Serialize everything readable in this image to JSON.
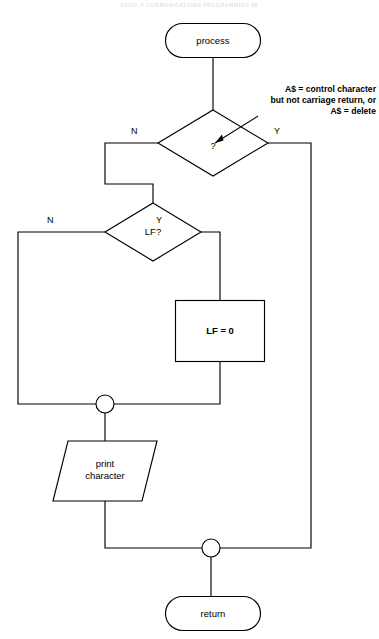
{
  "page": {
    "running_head": "CHAP. 4     COMMUNICATIONS PROGRAMMING          99",
    "width": 379,
    "height": 639,
    "background": "#ffffff",
    "line_color": "#000000"
  },
  "figure": {
    "type": "flowchart",
    "nodes": [
      {
        "id": "start-terminal",
        "shape": "terminator",
        "label": "process",
        "x": 165,
        "y": 23,
        "w": 96,
        "h": 35
      },
      {
        "id": "control-char-decision",
        "shape": "diamond",
        "label": "?",
        "x": 172,
        "y": 110,
        "w": 110,
        "h": 66
      },
      {
        "id": "lf-decision",
        "shape": "diamond",
        "label": "LF?",
        "x": 105,
        "y": 203,
        "w": 96,
        "h": 58
      },
      {
        "id": "lf-assign-process",
        "shape": "rectangle",
        "label": "LF = ⁠0",
        "x": 175,
        "y": 300,
        "w": 90,
        "h": 62
      },
      {
        "id": "print-character-io",
        "shape": "parallelogram",
        "label_line1": "print",
        "label_line2": "character",
        "x": 53,
        "y": 441,
        "w": 104,
        "h": 60
      },
      {
        "id": "merge-junction-upper",
        "shape": "circle",
        "label": "",
        "x": 105,
        "y": 404,
        "r": 9
      },
      {
        "id": "merge-junction-lower",
        "shape": "circle",
        "label": "",
        "x": 211,
        "y": 548,
        "r": 9
      },
      {
        "id": "end-terminal",
        "shape": "terminator",
        "label": "return",
        "x": 165,
        "y": 596,
        "w": 96,
        "h": 35
      }
    ],
    "branch_labels": [
      {
        "id": "control-char-no",
        "text": "N",
        "x": 131,
        "y": 133
      },
      {
        "id": "control-char-yes",
        "text": "Y",
        "x": 280,
        "y": 133
      },
      {
        "id": "lf-no",
        "text": "N",
        "x": 49,
        "y": 222
      },
      {
        "id": "lf-yes",
        "text": "Y",
        "x": 157,
        "y": 222
      }
    ],
    "annotation": {
      "id": "control-char-annotation",
      "line1": "A$ = control character",
      "line2": "but not carriage return, or",
      "line3": "A$ = delete",
      "x": 228,
      "y": 84,
      "w": 148,
      "arrow_from": [
        251,
        119
      ],
      "arrow_to": [
        231,
        141
      ]
    },
    "edges": [
      {
        "id": "edge-start-to-decision",
        "from": "start-terminal",
        "to": "control-char-decision"
      },
      {
        "id": "edge-decision-no-to-lf",
        "from": "control-char-decision",
        "to": "lf-decision",
        "label": "N"
      },
      {
        "id": "edge-decision-yes-to-lower-merge",
        "from": "control-char-decision",
        "to": "merge-junction-lower",
        "label": "Y"
      },
      {
        "id": "edge-lf-yes-to-assign",
        "from": "lf-decision",
        "to": "lf-assign-process",
        "label": "Y"
      },
      {
        "id": "edge-lf-no-to-upper-merge",
        "from": "lf-decision",
        "to": "merge-junction-upper",
        "label": "N"
      },
      {
        "id": "edge-assign-to-upper-merge",
        "from": "lf-assign-process",
        "to": "merge-junction-upper"
      },
      {
        "id": "edge-upper-merge-to-print",
        "from": "merge-junction-upper",
        "to": "print-character-io"
      },
      {
        "id": "edge-print-to-lower-merge",
        "from": "print-character-io",
        "to": "merge-junction-lower"
      },
      {
        "id": "edge-lower-merge-to-return",
        "from": "merge-junction-lower",
        "to": "end-terminal"
      }
    ]
  }
}
